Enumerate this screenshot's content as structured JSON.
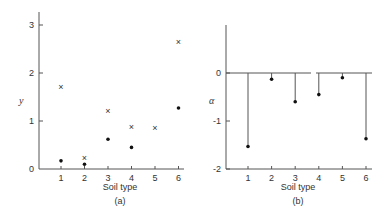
{
  "chart_data": [
    {
      "type": "scatter",
      "panel_label": "(a)",
      "xlabel": "Soil type",
      "ylabel": "y",
      "x_ticks": [
        "1",
        "2",
        "3",
        "4",
        "5",
        "6"
      ],
      "y_ticks": [
        "0",
        "1",
        "2",
        "3"
      ],
      "ylim": [
        0,
        3.3
      ],
      "grid": false,
      "categories": [
        1,
        2,
        3,
        4,
        5,
        6
      ],
      "series": [
        {
          "name": "cross",
          "marker": "x",
          "values": [
            1.7,
            0.22,
            1.2,
            0.88,
            0.85,
            2.65
          ]
        },
        {
          "name": "dot",
          "marker": "dot",
          "values": [
            0.17,
            0.1,
            0.62,
            0.45,
            null,
            1.27
          ]
        }
      ]
    },
    {
      "type": "stem",
      "panel_label": "(b)",
      "xlabel": "Soil type",
      "ylabel": "α",
      "x_ticks": [
        "1",
        "2",
        "3",
        "4",
        "5",
        "6"
      ],
      "y_ticks": [
        "0",
        "-1",
        "-2"
      ],
      "ylim": [
        -2,
        1
      ],
      "grid": false,
      "categories": [
        1,
        2,
        3,
        4,
        5,
        6
      ],
      "values": [
        -1.53,
        -0.13,
        -0.6,
        -0.45,
        -0.1,
        -1.37
      ]
    }
  ]
}
